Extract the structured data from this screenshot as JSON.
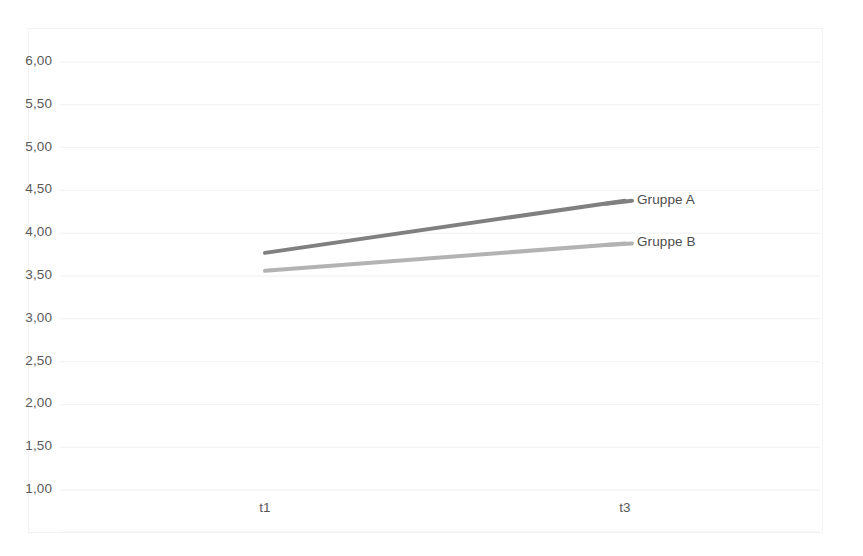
{
  "chart_data": {
    "type": "line",
    "title": "",
    "subtitle": "",
    "xlabel": "",
    "ylabel": "",
    "categories": [
      "t1",
      "t3"
    ],
    "series": [
      {
        "name": "Gruppe A",
        "values": [
          3.77,
          4.38
        ],
        "color": "#808080"
      },
      {
        "name": "Gruppe B",
        "values": [
          3.56,
          3.88
        ],
        "color": "#b3b3b3"
      }
    ],
    "ylim": [
      1.0,
      6.0
    ],
    "ytick_values": [
      6.0,
      5.5,
      5.0,
      4.5,
      4.0,
      3.5,
      3.0,
      2.5,
      2.0,
      1.5,
      1.0
    ],
    "ytick_labels": [
      "6,00",
      "5,50",
      "5,00",
      "4,50",
      "4,00",
      "3,50",
      "3,00",
      "2,50",
      "2,00",
      "1,50",
      "1,00"
    ],
    "xtick_labels": [
      "t1",
      "t3"
    ],
    "grid": true,
    "grid_color": "#f0f0f0",
    "legend_position": "inline-right",
    "decimal_separator": ",",
    "background_color": "#ffffff",
    "frame_color": "#f2f2f2",
    "axis_label_color": "#5a5a5a"
  },
  "axis": {
    "y_labels": [
      "6,00",
      "5,50",
      "5,00",
      "4,50",
      "4,00",
      "3,50",
      "3,00",
      "2,50",
      "2,00",
      "1,50",
      "1,00"
    ],
    "x_labels": [
      "t1",
      "t3"
    ]
  },
  "legend": {
    "items": [
      {
        "label": "Gruppe A"
      },
      {
        "label": "Gruppe B"
      }
    ]
  }
}
